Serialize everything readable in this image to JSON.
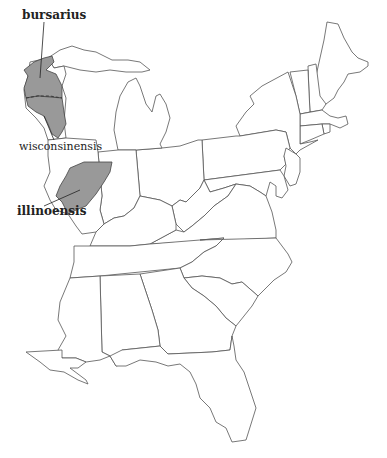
{
  "map": {
    "region": "Eastern United States",
    "colors": {
      "range_fill": "#999999",
      "state_outline": "#555555",
      "background": "#ffffff"
    },
    "labels": [
      {
        "id": "bursarius",
        "text": "bursarius",
        "weight": "bold",
        "x": 22,
        "y": 8
      },
      {
        "id": "wisconsinensis",
        "text": "wisconsinensis",
        "weight": "normal",
        "x": 19,
        "y": 140
      },
      {
        "id": "illinoensis",
        "text": "illinoensis",
        "weight": "bold",
        "x": 17,
        "y": 204
      }
    ],
    "ranges": [
      {
        "id": "bursarius-range",
        "taxon": "bursarius"
      },
      {
        "id": "wisconsinensis-range",
        "taxon": "wisconsinensis"
      },
      {
        "id": "illinoensis-range",
        "taxon": "illinoensis"
      }
    ]
  }
}
